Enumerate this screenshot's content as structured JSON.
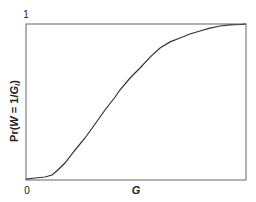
{
  "chart_data": {
    "type": "line",
    "title": "",
    "xlabel": "G",
    "ylabel": "Pr(W = 1/G_i)",
    "ylabel_parts": {
      "prefix": "Pr(",
      "var": "W",
      "mid": " = 1/",
      "var2": "G",
      "sub": "i",
      "suffix": ")"
    },
    "xlim": [
      0,
      1
    ],
    "ylim": [
      0,
      1
    ],
    "x_ticks": [
      {
        "value": 0,
        "label": "0"
      }
    ],
    "y_ticks": [
      {
        "value": 1,
        "label": "1"
      }
    ],
    "grid": false,
    "legend": null,
    "series": [
      {
        "name": "cumulative",
        "color": "#333333",
        "x": [
          0,
          0.041,
          0.086,
          0.118,
          0.145,
          0.177,
          0.223,
          0.268,
          0.314,
          0.359,
          0.405,
          0.427,
          0.473,
          0.518,
          0.564,
          0.609,
          0.655,
          0.7,
          0.745,
          0.791,
          0.836,
          0.882,
          0.927,
          0.973,
          1
        ],
        "y": [
          0.006,
          0.013,
          0.019,
          0.032,
          0.064,
          0.109,
          0.192,
          0.269,
          0.359,
          0.449,
          0.532,
          0.577,
          0.654,
          0.718,
          0.788,
          0.846,
          0.885,
          0.91,
          0.936,
          0.955,
          0.974,
          0.987,
          0.994,
          0.997,
          1
        ]
      }
    ]
  },
  "labels": {
    "x_zero": "0",
    "y_one": "1",
    "x_axis": "G",
    "y_prefix": "Pr(",
    "y_var": "W",
    "y_mid": " = 1/",
    "y_var2": "G",
    "y_sub": "i",
    "y_suffix": ")"
  }
}
